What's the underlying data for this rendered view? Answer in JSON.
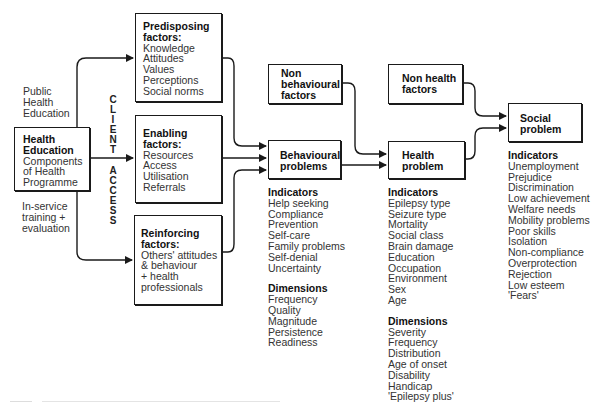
{
  "diagram": {
    "colors": {
      "line": "#1a1a1a",
      "text": "#333333",
      "background": "#ffffff"
    },
    "source": {
      "title_line1": "Health",
      "title_line2": "Education",
      "body": [
        "Components",
        "of Health",
        "Programme"
      ]
    },
    "side_labels": {
      "top": [
        "Public",
        "Health",
        "Education"
      ],
      "bottom": [
        "In-service",
        "training +",
        "evaluation"
      ]
    },
    "client_access": {
      "word1": [
        "C",
        "L",
        "I",
        "E",
        "N",
        "T"
      ],
      "word2": [
        "A",
        "C",
        "C",
        "E",
        "S",
        "S"
      ]
    },
    "factors": [
      {
        "title": [
          "Predisposing",
          "factors:"
        ],
        "items": [
          "Knowledge",
          "Attitudes",
          "Values",
          "Perceptions",
          "Social norms"
        ]
      },
      {
        "title": [
          "Enabling",
          "factors:"
        ],
        "items": [
          "Resources",
          "Access",
          "Utilisation",
          "Referrals"
        ]
      },
      {
        "title": [
          "Reinforcing",
          "factors:"
        ],
        "items": [
          "Others' attitudes",
          "& behaviour",
          "+ health",
          "professionals"
        ]
      }
    ],
    "non_behavioural": {
      "label": [
        "Non",
        "behavioural",
        "factors"
      ]
    },
    "non_health": {
      "label": [
        "Non health",
        "factors"
      ]
    },
    "behavioural": {
      "label": [
        "Behavioural",
        "problems"
      ],
      "indicators_title": "Indicators",
      "indicators": [
        "Help seeking",
        "Compliance",
        "Prevention",
        "Self-care",
        "Family problems",
        "Self-denial",
        "Uncertainty"
      ],
      "dimensions_title": "Dimensions",
      "dimensions": [
        "Frequency",
        "Quality",
        "Magnitude",
        "Persistence",
        "Readiness"
      ]
    },
    "health": {
      "label": [
        "Health",
        "problem"
      ],
      "indicators_title": "Indicators",
      "indicators": [
        "Epilepsy type",
        "Seizure type",
        "Mortality",
        "Social class",
        "Brain damage",
        "Education",
        "Occupation",
        "Environment",
        "Sex",
        "Age"
      ],
      "dimensions_title": "Dimensions",
      "dimensions": [
        "Severity",
        "Frequency",
        "Distribution",
        "Age of onset",
        "Disability",
        "Handicap",
        "'Epilepsy plus'"
      ]
    },
    "social": {
      "label": [
        "Social",
        "problem"
      ],
      "indicators_title": "Indicators",
      "indicators": [
        "Unemployment",
        "Prejudice",
        "Discrimination",
        "Low achievement",
        "Welfare needs",
        "Mobility problems",
        "Poor skills",
        "Isolation",
        "Non-compliance",
        "Overprotection",
        "Rejection",
        "Low esteem",
        "'Fears'"
      ]
    }
  }
}
